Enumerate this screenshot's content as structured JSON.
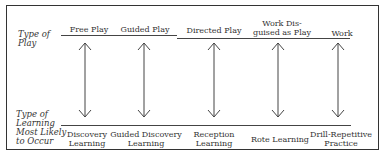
{
  "diagram": {
    "row_labels": {
      "top": "Type of\nPlay",
      "bottom": "Type of\nLearning\nMost Likely\nto Occur"
    },
    "columns": [
      {
        "play": "Free Play",
        "learning": "Discovery\nLearning"
      },
      {
        "play": "Guided Play",
        "learning": "Guided Discovery\nLearning"
      },
      {
        "play": "Directed Play",
        "learning": "Reception\nLearning"
      },
      {
        "play": "Work Dis-\nguised as Play",
        "learning": "Rote Learning"
      },
      {
        "play": "Work",
        "learning": "Drill-Repetitive\nPractice"
      }
    ],
    "connector": "double-headed-arrow"
  }
}
